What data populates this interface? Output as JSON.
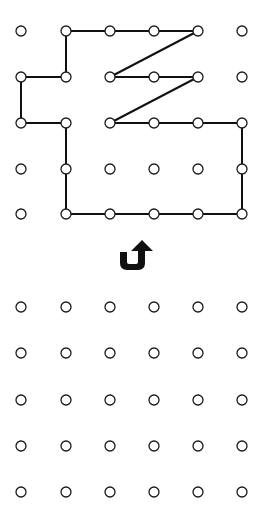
{
  "diagram": {
    "type": "dot-grid-reflection-puzzle",
    "background": "#ffffff",
    "line_color": "#111111",
    "dot_stroke_color": "#1a1a1a",
    "grid_columns": 6,
    "grid_rows": 5,
    "column_x": [
      21,
      66,
      110,
      154,
      198,
      242
    ],
    "top_grid": {
      "row_y": [
        31,
        77,
        123,
        169,
        214
      ],
      "shape_path_grid_points": [
        [
          1,
          0
        ],
        [
          4,
          0
        ],
        [
          2,
          1
        ],
        [
          4,
          1
        ],
        [
          2,
          2
        ],
        [
          5,
          2
        ],
        [
          5,
          4
        ],
        [
          1,
          4
        ],
        [
          1,
          2
        ],
        [
          0,
          2
        ],
        [
          0,
          1
        ],
        [
          1,
          1
        ],
        [
          1,
          0
        ]
      ]
    },
    "bottom_grid": {
      "row_y": [
        307,
        353,
        400,
        446,
        492
      ],
      "shape_path_grid_points": []
    },
    "instruction_icon": {
      "name": "u-turn-up-arrow-icon",
      "meaning": "flip / reflect the shape",
      "glyph": "⮍"
    }
  }
}
